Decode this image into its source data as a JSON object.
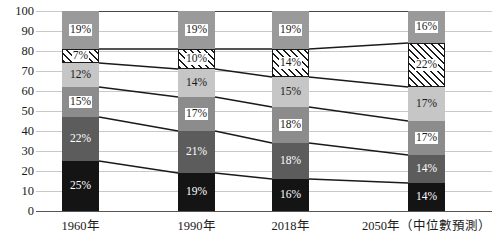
{
  "chart_data": {
    "type": "bar",
    "subtype": "stacked-bar-100-percent",
    "title": "",
    "xlabel": "",
    "ylabel": "",
    "ylim": [
      0,
      100
    ],
    "yticks": [
      0,
      10,
      20,
      30,
      40,
      50,
      60,
      70,
      80,
      90,
      100
    ],
    "grid": true,
    "legend": "none",
    "categories": [
      "1960年",
      "1990年",
      "2018年",
      "2050年（中位數預測）"
    ],
    "series": [
      {
        "name": "segment-1",
        "fill": "solid-black",
        "color": "#141414",
        "values": [
          25,
          19,
          16,
          14
        ],
        "labels": [
          "25%",
          "19%",
          "16%",
          "14%"
        ]
      },
      {
        "name": "segment-2",
        "fill": "solid-dark-gray",
        "color": "#5c5c5c",
        "values": [
          22,
          21,
          18,
          14
        ],
        "labels": [
          "22%",
          "21%",
          "18%",
          "14%"
        ]
      },
      {
        "name": "segment-3",
        "fill": "solid-mid-gray",
        "color": "#8c8c8c",
        "values": [
          15,
          17,
          18,
          17
        ],
        "labels": [
          "15%",
          "17%",
          "18%",
          "17%"
        ]
      },
      {
        "name": "segment-4",
        "fill": "solid-light-gray",
        "color": "#c6c6c6",
        "values": [
          12,
          14,
          15,
          17
        ],
        "labels": [
          "12%",
          "14%",
          "15%",
          "17%"
        ]
      },
      {
        "name": "segment-5",
        "fill": "diagonal-hatch",
        "color": "#ffffff",
        "values": [
          7,
          10,
          14,
          22
        ],
        "labels": [
          "7%",
          "10%",
          "14%",
          "22%"
        ]
      },
      {
        "name": "segment-6",
        "fill": "solid-gray",
        "color": "#9a9a9a",
        "values": [
          19,
          19,
          19,
          16
        ],
        "labels": [
          "19%",
          "19%",
          "19%",
          "16%"
        ]
      }
    ]
  },
  "axis": {
    "y_tick_labels": [
      "100",
      "90",
      "80",
      "70",
      "60",
      "50",
      "40",
      "30",
      "20",
      "10",
      "0"
    ],
    "x_tick_labels": [
      "1960年",
      "1990年",
      "2018年",
      "2050年（中位數預測）"
    ]
  },
  "colors": {
    "gridline": "#c9c9c9",
    "axis": "#555555",
    "connector": "#1a1a1a",
    "background": "#ffffff"
  }
}
